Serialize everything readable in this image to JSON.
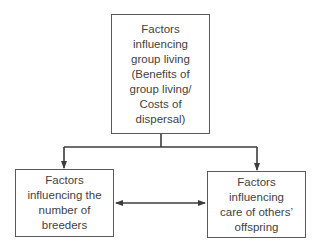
{
  "diagram": {
    "type": "flowchart",
    "nodes": [
      {
        "id": "group-living",
        "label": "Factors\ninfluencing\ngroup living\n(Benefits of\ngroup living/\nCosts of\ndispersal)"
      },
      {
        "id": "number-of-breeders",
        "label": "Factors\ninfluencing the\nnumber of\nbreeders"
      },
      {
        "id": "care-of-offspring",
        "label": "Factors\ninfluencing\ncare of others’\noffspring"
      }
    ],
    "edges": [
      {
        "from": "group-living",
        "to": "number-of-breeders",
        "direction": "forward"
      },
      {
        "from": "group-living",
        "to": "care-of-offspring",
        "direction": "forward"
      },
      {
        "from": "number-of-breeders",
        "to": "care-of-offspring",
        "direction": "bidirectional"
      }
    ],
    "colors": {
      "line": "#3c3c3c",
      "box_border": "#5a5a5a",
      "text": "#3f3f3f",
      "background": "#ffffff"
    }
  }
}
